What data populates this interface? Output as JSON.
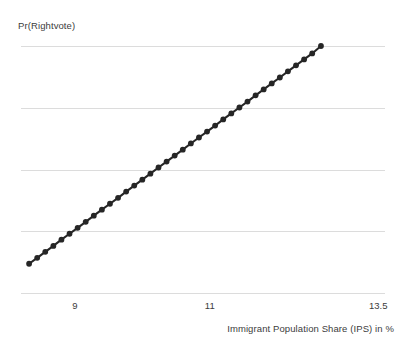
{
  "chart_data": {
    "type": "scatter",
    "title": "",
    "subtitle": "",
    "xlabel": "Immigrant Population Share (IPS) in %",
    "ylabel": "Pr(Rightvote)",
    "xlim": [
      8.2,
      13.6
    ],
    "ylim": [
      0,
      1
    ],
    "xticks": [
      9,
      11,
      13.5
    ],
    "xtick_labels": [
      "9",
      "11",
      "13.5"
    ],
    "yticks": [],
    "ytick_labels": [],
    "grid": "horizontal",
    "gridline_count": 5,
    "legend": "none",
    "marker": "filled-circle",
    "marker_color": "#262626",
    "line_color": "#262626",
    "gridline_color": "#dcdcdc",
    "x": [
      8.32,
      8.44,
      8.56,
      8.68,
      8.8,
      8.92,
      9.04,
      9.16,
      9.28,
      9.4,
      9.52,
      9.64,
      9.76,
      9.88,
      10.0,
      10.12,
      10.24,
      10.36,
      10.48,
      10.6,
      10.72,
      10.84,
      10.96,
      11.08,
      11.2,
      11.32,
      11.44,
      11.56,
      11.68,
      11.8,
      11.92,
      12.04,
      12.16,
      12.28,
      12.4,
      12.52,
      12.65
    ],
    "y": [
      0.122,
      0.146,
      0.17,
      0.194,
      0.219,
      0.243,
      0.267,
      0.291,
      0.316,
      0.34,
      0.364,
      0.388,
      0.413,
      0.437,
      0.461,
      0.485,
      0.51,
      0.534,
      0.558,
      0.582,
      0.607,
      0.631,
      0.655,
      0.679,
      0.704,
      0.728,
      0.752,
      0.776,
      0.801,
      0.825,
      0.849,
      0.873,
      0.898,
      0.922,
      0.946,
      0.97,
      1.0
    ]
  }
}
